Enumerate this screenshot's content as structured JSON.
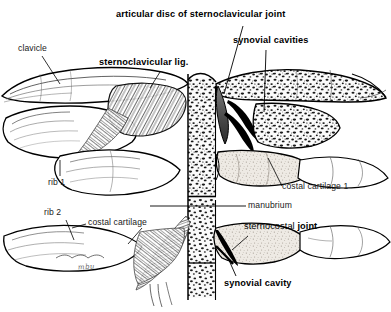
{
  "figure": {
    "subject": "sternoclavicular joint",
    "view": "anterior coronal section",
    "background_color": "#ffffff",
    "ink_color": "#000000",
    "signature": "mbu"
  },
  "labels": {
    "articular_disc": "articular disc of sternoclavicular joint",
    "synovial_cavities": "synovial cavities",
    "clavicle": "clavicle",
    "sternoclavicular_lig": "sternoclavicular lig.",
    "rib_1": "rib 1",
    "rib_2": "rib 2",
    "costal_cartilage": "costal cartilage",
    "costal_cartilage_1": "costal cartilage 1",
    "manubrium": "manubrium",
    "sternocostal_prefix": "sternocostal ",
    "sternocostal_joint_word": "joint",
    "synovial_cavity": "synovial cavity"
  },
  "structures": [
    {
      "name": "clavicle-left",
      "kind": "bone",
      "side": "left"
    },
    {
      "name": "clavicle-right",
      "kind": "bone",
      "side": "right"
    },
    {
      "name": "manubrium",
      "kind": "bone-cancellous",
      "side": "midline"
    },
    {
      "name": "articular-disc",
      "kind": "fibrocartilage",
      "side": "right"
    },
    {
      "name": "synovial-cavity-upper",
      "kind": "cavity",
      "side": "right"
    },
    {
      "name": "synovial-cavity-lower",
      "kind": "cavity",
      "side": "right"
    },
    {
      "name": "sternoclavicular-ligament",
      "kind": "ligament",
      "side": "left"
    },
    {
      "name": "costal-cartilage-1",
      "kind": "cartilage",
      "side": "right"
    },
    {
      "name": "costal-cartilage-2",
      "kind": "cartilage",
      "side": "both"
    },
    {
      "name": "rib-1",
      "kind": "bone",
      "side": "left"
    },
    {
      "name": "rib-2",
      "kind": "bone",
      "side": "left"
    },
    {
      "name": "sternocostal-joint-synovial-cavity",
      "kind": "cavity",
      "side": "right"
    }
  ]
}
